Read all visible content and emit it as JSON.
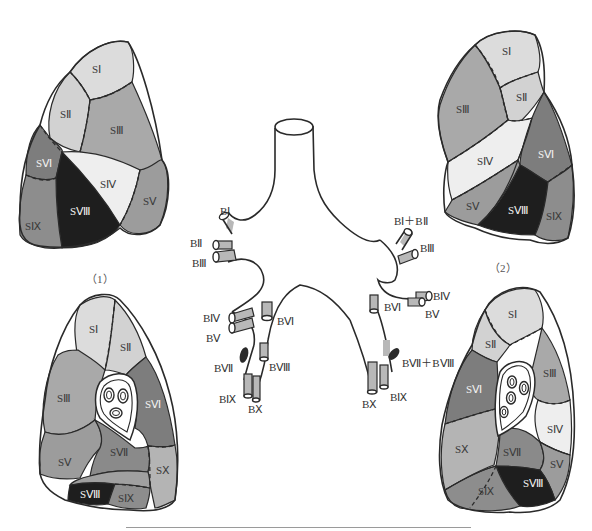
{
  "colors": {
    "s1": "#dcdcdc",
    "s2": "#d2d2d2",
    "s3": "#a9a9a9",
    "s4": "#eeeeee",
    "s5": "#9c9c9c",
    "s6": "#7d7d7d",
    "s7": "#1e1e1e",
    "s8": "#1e1e1e",
    "s9": "#8d8d8d",
    "s10": "#b4b4b4",
    "outline": "#2a2a2a",
    "bronchus_shade": "#b8b8b8",
    "bronchus_dark": "#2a2a2a",
    "rule": "#9a9a9a"
  },
  "panels": {
    "top_left": {
      "caption": "（1）",
      "segments": {
        "s1": "SⅠ",
        "s2": "SⅡ",
        "s3": "SⅢ",
        "s4": "SⅣ",
        "s5": "SⅤ",
        "s6": "SⅥ",
        "s8": "SⅧ",
        "s9": "SⅨ"
      }
    },
    "top_right": {
      "caption": "（2）",
      "segments": {
        "s1": "SⅠ",
        "s2": "SⅡ",
        "s3": "SⅢ",
        "s4": "SⅣ",
        "s5": "SⅤ",
        "s6": "SⅥ",
        "s8": "SⅧ",
        "s9": "SⅨ"
      }
    },
    "bottom_left": {
      "segments": {
        "s1": "SⅠ",
        "s2": "SⅡ",
        "s3": "SⅢ",
        "s5": "SⅤ",
        "s6": "SⅥ",
        "s7": "SⅦ",
        "s8": "SⅧ",
        "s9": "SⅨ",
        "s10": "SⅩ"
      }
    },
    "bottom_right": {
      "segments": {
        "s1": "SⅠ",
        "s2": "SⅡ",
        "s3": "SⅢ",
        "s4": "SⅣ",
        "s5": "SⅤ",
        "s6": "SⅥ",
        "s7": "SⅦ",
        "s8": "SⅧ",
        "s9": "SⅨ",
        "s10": "SⅩ"
      }
    }
  },
  "bronchial_tree": {
    "right": {
      "b1": "BⅠ",
      "b2": "BⅡ",
      "b3": "BⅢ",
      "b4": "BⅣ",
      "b5": "BⅤ",
      "b6": "BⅥ",
      "b7": "BⅦ",
      "b8": "BⅧ",
      "b9": "BⅨ",
      "b10": "BⅩ"
    },
    "left": {
      "b1_2": "BⅠ＋BⅡ",
      "b3": "BⅢ",
      "b4": "BⅣ",
      "b5": "BⅤ",
      "b6": "BⅥ",
      "b7_8": "BⅦ＋BⅧ",
      "b9": "BⅨ",
      "b10": "BⅩ"
    }
  }
}
